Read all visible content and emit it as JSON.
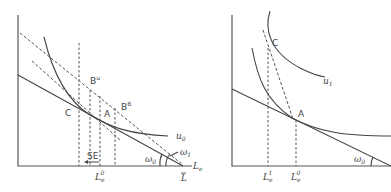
{
  "left_panel": {
    "points": {
      "C": "C",
      "A": "A",
      "Bu": "B",
      "Bu_sup": "u",
      "BB": "B",
      "BB_sup": "B"
    },
    "curve_label": "u",
    "curve_sub": "0",
    "se_label": "SE",
    "angle_w0": "ω",
    "angle_w0_sub": "0",
    "angle_w1": "ω",
    "angle_w1_sub": "1",
    "x_axis_label": "L",
    "x_axis_sub": "e",
    "tick_L0": "L",
    "tick_L0_sub": "e",
    "tick_L0_sup": "0",
    "tick_Lbar": "L"
  },
  "right_panel": {
    "points": {
      "C": "C",
      "A": "A"
    },
    "curve_label": "u",
    "curve_sub": "1",
    "angle_w0": "ω",
    "angle_w0_sub": "0",
    "tick_L1": "L",
    "tick_L1_sub": "e",
    "tick_L1_sup": "1",
    "tick_L0": "L",
    "tick_L0_sub": "e",
    "tick_L0_sup": "0"
  },
  "colors": {
    "line": "#444444",
    "background": "#ffffff"
  }
}
